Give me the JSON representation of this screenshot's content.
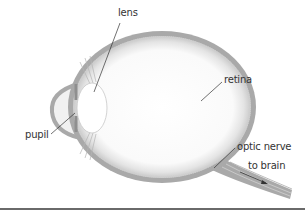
{
  "diagram": {
    "labels": {
      "lens": "lens",
      "retina": "retina",
      "pupil": "pupil",
      "optic_nerve": "optic nerve",
      "to_brain": "to brain"
    },
    "colors": {
      "sclera": "#a9a9a9",
      "retina_texture": "#c4c4c4",
      "interior": "#ffffff",
      "leader_line": "#333333",
      "divider": "#6a6a6a"
    }
  }
}
